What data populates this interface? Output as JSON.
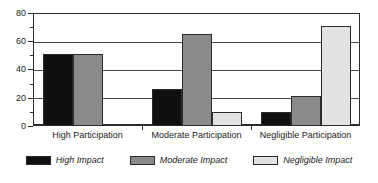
{
  "chart_data": {
    "type": "bar",
    "title": "",
    "xlabel": "",
    "ylabel": "",
    "ylim": [
      0,
      80
    ],
    "grid": true,
    "legend_position": "bottom",
    "categories": [
      "High Participation",
      "Moderate Participation",
      "Negligible Participation"
    ],
    "series": [
      {
        "name": "High Impact",
        "color": "#101010",
        "values": [
          51,
          26,
          10
        ]
      },
      {
        "name": "Moderate Impact",
        "color": "#8a8a8a",
        "values": [
          51,
          65,
          21
        ]
      },
      {
        "name": "Negligible Impact",
        "color": "#e2e2e2",
        "values": [
          0,
          10,
          71
        ]
      }
    ],
    "y_ticks_major": [
      0,
      20,
      40,
      60,
      80
    ],
    "y_ticks_minor": [
      10,
      30,
      50,
      70
    ],
    "y_tick_labels": [
      "0",
      "20",
      "40",
      "60",
      "80"
    ]
  },
  "axis": {
    "y": {
      "t0": "0",
      "t20": "20",
      "t40": "40",
      "t60": "60",
      "t80": "80"
    },
    "x": {
      "cat0": "High Participation",
      "cat1": "Moderate Participation",
      "cat2": "Negligible Participation"
    }
  },
  "legend": {
    "items": [
      {
        "label": "High Impact",
        "swatch": "legend-swatch-high-impact"
      },
      {
        "label": "Moderate Impact",
        "swatch": "legend-swatch-moderate-impact"
      },
      {
        "label": "Negligible Impact",
        "swatch": "legend-swatch-negligible-impact"
      }
    ]
  }
}
